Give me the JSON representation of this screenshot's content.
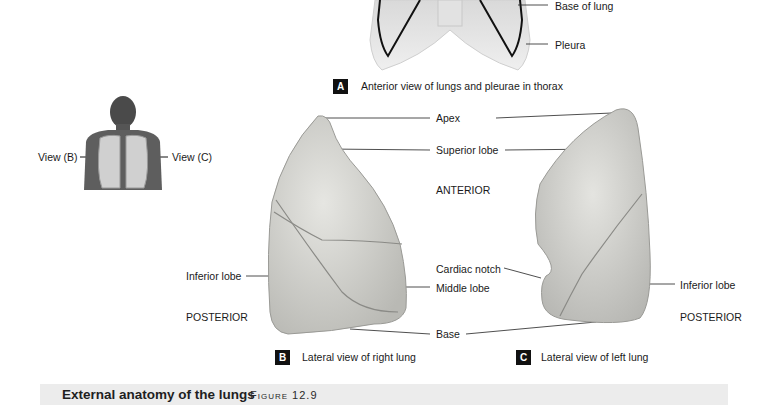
{
  "panel_a": {
    "badge": "A",
    "caption": "Anterior view of lungs and pleurae in thorax",
    "labels": {
      "base_of_lung": "Base  of lung",
      "pleura": "Pleura"
    }
  },
  "figure_person": {
    "view_b": "View (B)",
    "view_c": "View (C)"
  },
  "center_labels": {
    "apex": "Apex",
    "superior_lobe": "Superior lobe",
    "anterior": "ANTERIOR",
    "cardiac_notch": "Cardiac notch",
    "middle_lobe": "Middle lobe",
    "base": "Base"
  },
  "panel_b": {
    "badge": "B",
    "caption": "Lateral view of right lung",
    "labels": {
      "inferior_lobe": "Inferior lobe",
      "posterior": "POSTERIOR"
    }
  },
  "panel_c": {
    "badge": "C",
    "caption": "Lateral view of left lung",
    "labels": {
      "inferior_lobe": "Inferior lobe",
      "posterior": "POSTERIOR"
    }
  },
  "footer": {
    "title": "External anatomy of the lungs",
    "figure": "Figure 12.9"
  }
}
